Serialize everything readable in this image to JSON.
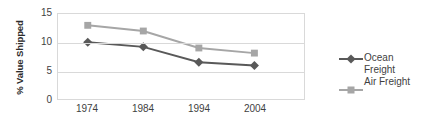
{
  "chart_data": {
    "type": "line",
    "title": "",
    "xlabel": "",
    "ylabel": "% Value Shipped",
    "categories": [
      "1974",
      "1984",
      "1994",
      "2004"
    ],
    "x": [
      1974,
      1984,
      1994,
      2004
    ],
    "ylim": [
      0,
      15
    ],
    "yticks": [
      0,
      5,
      10,
      15
    ],
    "grid": "horizontal",
    "legend_position": "right",
    "series": [
      {
        "name": "Ocean Freight",
        "label_lines": "Ocean\nFreight",
        "color": "#595959",
        "marker": "diamond",
        "values": [
          10.0,
          9.2,
          6.5,
          5.9
        ]
      },
      {
        "name": "Air Freight",
        "label_lines": "Air Freight",
        "color": "#a6a6a6",
        "marker": "square",
        "values": [
          13.0,
          12.0,
          9.0,
          8.1
        ]
      }
    ]
  },
  "axes": {
    "y_title": "% Value Shipped",
    "y_tick_labels": [
      "15",
      "10",
      "5",
      "0"
    ],
    "x_tick_labels": [
      "1974",
      "1984",
      "1994",
      "2004"
    ]
  },
  "legend": {
    "entries": [
      {
        "label": "Ocean\nFreight",
        "color": "#595959",
        "marker": "diamond"
      },
      {
        "label": "Air Freight",
        "color": "#a6a6a6",
        "marker": "square"
      }
    ]
  },
  "colors": {
    "ocean": "#595959",
    "air": "#a6a6a6",
    "gridline": "#d9d9d9",
    "text": "#3f3f3f",
    "background": "#ffffff"
  }
}
